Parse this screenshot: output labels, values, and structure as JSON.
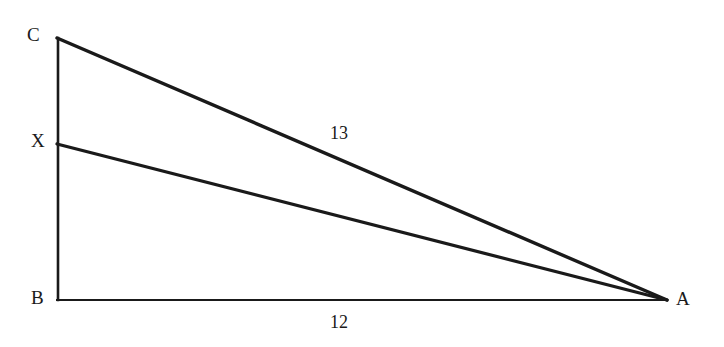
{
  "figure": {
    "kind": "geometry-diagram",
    "background_color": "#ffffff",
    "stroke_color": "#1a1a1a",
    "vertices": [
      {
        "id": "C",
        "label": "C",
        "x": 57,
        "y": 38,
        "label_x": 27,
        "label_y": 25
      },
      {
        "id": "X",
        "label": "X",
        "x": 58,
        "y": 144,
        "label_x": 31,
        "label_y": 131
      },
      {
        "id": "B",
        "label": "B",
        "x": 57,
        "y": 300,
        "label_x": 31,
        "label_y": 288
      },
      {
        "id": "A",
        "label": "A",
        "x": 667,
        "y": 300,
        "label_x": 676,
        "label_y": 289
      }
    ],
    "segments": [
      {
        "id": "BC",
        "from": "B",
        "to": "C",
        "x1": 58,
        "y1": 300,
        "x2": 58,
        "y2": 38,
        "stroke_width": 2.6,
        "label": null
      },
      {
        "id": "BA",
        "from": "B",
        "to": "A",
        "x1": 57,
        "y1": 300,
        "x2": 667,
        "y2": 300,
        "stroke_width": 2.0,
        "label": "12"
      },
      {
        "id": "CA",
        "from": "C",
        "to": "A",
        "x1": 57,
        "y1": 38,
        "x2": 667,
        "y2": 300,
        "stroke_width": 3.4,
        "label": "13"
      },
      {
        "id": "XA",
        "from": "X",
        "to": "A",
        "x1": 57,
        "y1": 144,
        "x2": 667,
        "y2": 300,
        "stroke_width": 3.2,
        "label": null
      }
    ],
    "measure_labels": [
      {
        "id": "CA-measure",
        "segment": "CA",
        "text": "13",
        "x": 330,
        "y": 124
      },
      {
        "id": "BA-measure",
        "segment": "BA",
        "text": "12",
        "x": 330,
        "y": 313
      }
    ]
  }
}
